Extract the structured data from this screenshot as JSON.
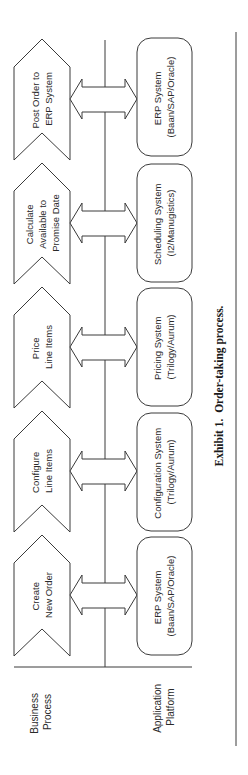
{
  "diagram": {
    "caption": "Exhibit 1.  Order-taking process.",
    "lanes": {
      "business": {
        "label_lines": [
          "Business",
          "Process"
        ]
      },
      "application": {
        "label_lines": [
          "Application",
          "Platform"
        ]
      }
    },
    "steps": [
      {
        "process_lines": [
          "Create",
          "New Order"
        ],
        "system_lines": [
          "ERP System",
          "(Baan/SAP/Oracle)"
        ]
      },
      {
        "process_lines": [
          "Configure",
          "Line Items"
        ],
        "system_lines": [
          "Configuration System",
          "(Trilogy/Aurum)"
        ]
      },
      {
        "process_lines": [
          "Price",
          "Line Items"
        ],
        "system_lines": [
          "Pricing System",
          "(Trilogy/Aurum)"
        ]
      },
      {
        "process_lines": [
          "Calculate",
          "Available to",
          "Promise Date"
        ],
        "system_lines": [
          "Scheduling System",
          "(I2/Manugistics)"
        ]
      },
      {
        "process_lines": [
          "Post Order to",
          "ERP System"
        ],
        "system_lines": [
          "ERP System",
          "(Baan/SAP/Oracle)"
        ]
      }
    ],
    "connector": "bidirectional-arrow",
    "colors": {
      "stroke": "#3a3a3a",
      "text": "#2a2a2a",
      "background": "#ffffff"
    }
  }
}
